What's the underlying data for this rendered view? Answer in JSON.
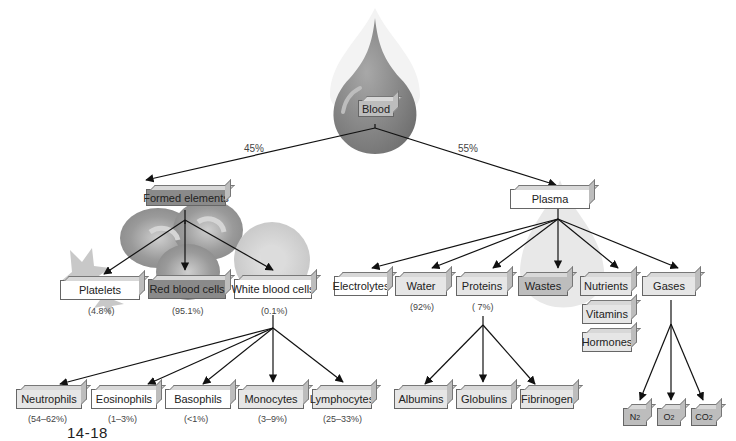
{
  "diagram": {
    "root": {
      "label": "Blood"
    },
    "split": {
      "formed_pct": "45%",
      "plasma_pct": "55%"
    },
    "formed_elements": {
      "label": "Formed elements",
      "children": [
        {
          "label": "Platelets",
          "pct": "(4.8%)"
        },
        {
          "label": "Red blood cells",
          "pct": "(95.1%)"
        },
        {
          "label": "White blood cells",
          "pct": "(0.1%)"
        }
      ],
      "white_blood_cells": [
        {
          "label": "Neutrophils",
          "pct": "(54–62%)"
        },
        {
          "label": "Eosinophils",
          "pct": "(1–3%)"
        },
        {
          "label": "Basophils",
          "pct": "(<1%)"
        },
        {
          "label": "Monocytes",
          "pct": "(3–9%)"
        },
        {
          "label": "Lymphocytes",
          "pct": "(25–33%)"
        }
      ]
    },
    "plasma": {
      "label": "Plasma",
      "children": [
        {
          "label": "Electrolytes",
          "pct": ""
        },
        {
          "label": "Water",
          "pct": "(92%)"
        },
        {
          "label": "Proteins",
          "pct": "( 7%)"
        },
        {
          "label": "Wastes",
          "pct": ""
        },
        {
          "label": "Nutrients",
          "pct": ""
        },
        {
          "label": "Gases",
          "pct": ""
        }
      ],
      "extra_stack": [
        {
          "label": "Vitamins"
        },
        {
          "label": "Hormones"
        }
      ],
      "proteins": [
        {
          "label": "Albumins"
        },
        {
          "label": "Globulins"
        },
        {
          "label": "Fibrinogen"
        }
      ],
      "gases": [
        {
          "base": "N",
          "sub": "2"
        },
        {
          "base": "O",
          "sub": "2"
        },
        {
          "base": "CO",
          "sub": "2"
        }
      ]
    },
    "figure_number": "14-18"
  }
}
